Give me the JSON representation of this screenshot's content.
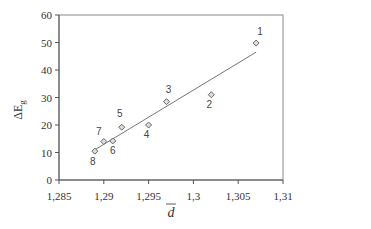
{
  "chart_data": {
    "type": "scatter",
    "title": "",
    "xlabel": "d̄",
    "ylabel": "ΔE_g",
    "xlim": [
      1.285,
      1.31
    ],
    "ylim": [
      0,
      60
    ],
    "xticks": [
      "1,285",
      "1,29",
      "1,295",
      "1,3",
      "1,305",
      "1,31"
    ],
    "xtick_values": [
      1.285,
      1.29,
      1.295,
      1.3,
      1.305,
      1.31
    ],
    "yticks": [
      "0",
      "10",
      "20",
      "30",
      "40",
      "50",
      "60"
    ],
    "ytick_values": [
      0,
      10,
      20,
      30,
      40,
      50,
      60
    ],
    "grid": false,
    "legend": null,
    "points": [
      {
        "label": "1",
        "x": 1.307,
        "y": 49.8
      },
      {
        "label": "2",
        "x": 1.302,
        "y": 31.0
      },
      {
        "label": "3",
        "x": 1.297,
        "y": 28.5
      },
      {
        "label": "4",
        "x": 1.295,
        "y": 20.0
      },
      {
        "label": "5",
        "x": 1.292,
        "y": 19.2
      },
      {
        "label": "6",
        "x": 1.291,
        "y": 14.2
      },
      {
        "label": "7",
        "x": 1.29,
        "y": 14.0
      },
      {
        "label": "8",
        "x": 1.289,
        "y": 10.5
      }
    ],
    "trendline": {
      "type": "linear",
      "x": [
        1.289,
        1.307
      ],
      "y": [
        11.0,
        46.5
      ]
    }
  },
  "axes": {
    "xlabel_display": "d",
    "ylabel_main": "ΔE",
    "ylabel_sub": "g"
  }
}
